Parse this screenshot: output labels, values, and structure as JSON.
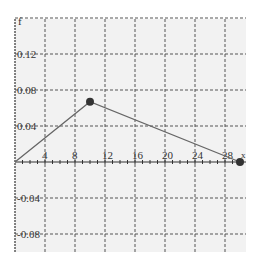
{
  "chart_data": {
    "type": "line",
    "title": "",
    "xlabel": "x",
    "ylabel": "f",
    "xlim": [
      0,
      31
    ],
    "ylim": [
      -0.1,
      0.16
    ],
    "grid": true,
    "x_ticks": [
      4,
      8,
      12,
      16,
      20,
      24,
      28
    ],
    "x_tick_labels": [
      "4",
      "8",
      "12",
      "16",
      "20",
      "24",
      "28"
    ],
    "y_ticks": [
      0.12,
      0.08,
      0.04,
      -0.04,
      -0.08
    ],
    "y_tick_labels": [
      "0.12",
      "0.08",
      "0.04",
      "-0.04",
      "-0.08"
    ],
    "series": [
      {
        "name": "f",
        "x": [
          0,
          10,
          30
        ],
        "y": [
          0,
          0.067,
          0
        ],
        "markers": [
          false,
          true,
          true
        ]
      }
    ],
    "colors": {
      "background": "#f2f2f2",
      "grid": "#555555",
      "line": "#666666",
      "marker": "#333333"
    }
  }
}
